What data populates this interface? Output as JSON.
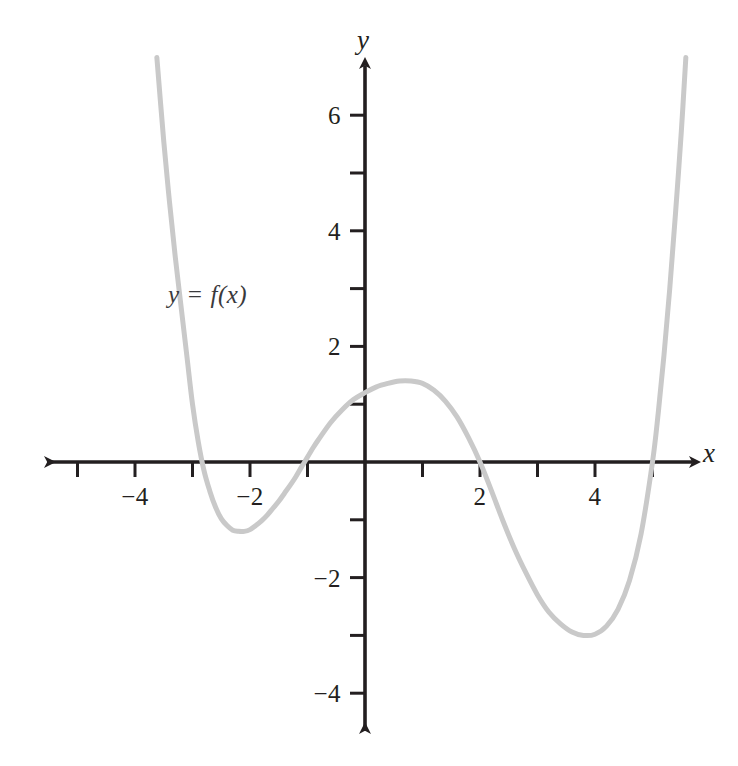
{
  "figure": {
    "background_color": "#ffffff",
    "width": 738,
    "height": 766
  },
  "axes": {
    "x_axis_name": "x",
    "y_axis_name": "y",
    "axis_color": "#231f20",
    "origin_px": {
      "x": 365,
      "y": 462
    },
    "unit_px": {
      "x": 57.5,
      "y": 57.8
    }
  },
  "annotations": {
    "curve_label": "y = f(x)",
    "curve_label_pos_px": {
      "x": 168,
      "y": 282
    }
  },
  "x_ticks": [
    {
      "value": -5,
      "label": ""
    },
    {
      "value": -4,
      "label": "−4"
    },
    {
      "value": -3,
      "label": ""
    },
    {
      "value": -2,
      "label": "−2"
    },
    {
      "value": -1,
      "label": ""
    },
    {
      "value": 1,
      "label": ""
    },
    {
      "value": 2,
      "label": "2"
    },
    {
      "value": 3,
      "label": ""
    },
    {
      "value": 4,
      "label": "4"
    },
    {
      "value": 5,
      "label": ""
    }
  ],
  "y_ticks": [
    {
      "value": 6,
      "label": "6"
    },
    {
      "value": 5,
      "label": ""
    },
    {
      "value": 4,
      "label": "4"
    },
    {
      "value": 3,
      "label": ""
    },
    {
      "value": 2,
      "label": "2"
    },
    {
      "value": 1,
      "label": ""
    },
    {
      "value": -1,
      "label": ""
    },
    {
      "value": -2,
      "label": "−2"
    },
    {
      "value": -3,
      "label": ""
    },
    {
      "value": -4,
      "label": "−4"
    }
  ],
  "chart_data": {
    "type": "line",
    "title": "",
    "subtitle": "",
    "xlabel": "x",
    "ylabel": "y",
    "xlim": [
      -5.9,
      5.75
    ],
    "ylim": [
      -4.65,
      7.0
    ],
    "grid": false,
    "legend": null,
    "curve_color": "#c9c9c9",
    "curve_width_px": 5,
    "series": [
      {
        "name": "y = f(x)",
        "description": "Quartic polynomial with four real roots; opens upward.",
        "roots": [
          -3.0,
          -1.05,
          2.0,
          5.0
        ],
        "y_intercept": 1.2,
        "local_extrema": [
          {
            "type": "local-min",
            "x": -2.1,
            "y": -1.2
          },
          {
            "type": "local-max",
            "x": 0.8,
            "y": 1.4
          },
          {
            "type": "local-min",
            "x": 3.9,
            "y": -3.0
          }
        ],
        "points": [
          {
            "x": -3.62,
            "y": 7.0
          },
          {
            "x": -3.5,
            "y": 5.55
          },
          {
            "x": -3.4,
            "y": 4.5
          },
          {
            "x": -3.3,
            "y": 3.55
          },
          {
            "x": -3.2,
            "y": 2.7
          },
          {
            "x": -3.1,
            "y": 1.85
          },
          {
            "x": -3.0,
            "y": 1.0
          },
          {
            "x": -2.9,
            "y": 0.35
          },
          {
            "x": -2.8,
            "y": -0.15
          },
          {
            "x": -2.7,
            "y": -0.5
          },
          {
            "x": -2.6,
            "y": -0.78
          },
          {
            "x": -2.5,
            "y": -0.98
          },
          {
            "x": -2.4,
            "y": -1.1
          },
          {
            "x": -2.3,
            "y": -1.18
          },
          {
            "x": -2.2,
            "y": -1.2
          },
          {
            "x": -2.1,
            "y": -1.2
          },
          {
            "x": -2.0,
            "y": -1.17
          },
          {
            "x": -1.9,
            "y": -1.1
          },
          {
            "x": -1.8,
            "y": -1.02
          },
          {
            "x": -1.7,
            "y": -0.92
          },
          {
            "x": -1.6,
            "y": -0.8
          },
          {
            "x": -1.5,
            "y": -0.68
          },
          {
            "x": -1.4,
            "y": -0.54
          },
          {
            "x": -1.3,
            "y": -0.4
          },
          {
            "x": -1.2,
            "y": -0.25
          },
          {
            "x": -1.1,
            "y": -0.08
          },
          {
            "x": -1.05,
            "y": 0.0
          },
          {
            "x": -0.9,
            "y": 0.25
          },
          {
            "x": -0.8,
            "y": 0.4
          },
          {
            "x": -0.6,
            "y": 0.68
          },
          {
            "x": -0.4,
            "y": 0.9
          },
          {
            "x": -0.2,
            "y": 1.08
          },
          {
            "x": 0.0,
            "y": 1.2
          },
          {
            "x": 0.2,
            "y": 1.3
          },
          {
            "x": 0.4,
            "y": 1.36
          },
          {
            "x": 0.6,
            "y": 1.4
          },
          {
            "x": 0.8,
            "y": 1.4
          },
          {
            "x": 1.0,
            "y": 1.36
          },
          {
            "x": 1.2,
            "y": 1.24
          },
          {
            "x": 1.4,
            "y": 1.05
          },
          {
            "x": 1.6,
            "y": 0.78
          },
          {
            "x": 1.8,
            "y": 0.42
          },
          {
            "x": 2.0,
            "y": 0.0
          },
          {
            "x": 2.2,
            "y": -0.5
          },
          {
            "x": 2.4,
            "y": -1.02
          },
          {
            "x": 2.6,
            "y": -1.5
          },
          {
            "x": 2.8,
            "y": -1.92
          },
          {
            "x": 3.0,
            "y": -2.3
          },
          {
            "x": 3.2,
            "y": -2.6
          },
          {
            "x": 3.4,
            "y": -2.8
          },
          {
            "x": 3.6,
            "y": -2.94
          },
          {
            "x": 3.8,
            "y": -3.0
          },
          {
            "x": 4.0,
            "y": -2.98
          },
          {
            "x": 4.2,
            "y": -2.84
          },
          {
            "x": 4.4,
            "y": -2.55
          },
          {
            "x": 4.6,
            "y": -2.05
          },
          {
            "x": 4.8,
            "y": -1.25
          },
          {
            "x": 5.0,
            "y": 0.0
          },
          {
            "x": 5.1,
            "y": 0.85
          },
          {
            "x": 5.2,
            "y": 1.85
          },
          {
            "x": 5.3,
            "y": 3.0
          },
          {
            "x": 5.4,
            "y": 4.3
          },
          {
            "x": 5.5,
            "y": 5.7
          },
          {
            "x": 5.58,
            "y": 7.0
          }
        ]
      }
    ]
  }
}
